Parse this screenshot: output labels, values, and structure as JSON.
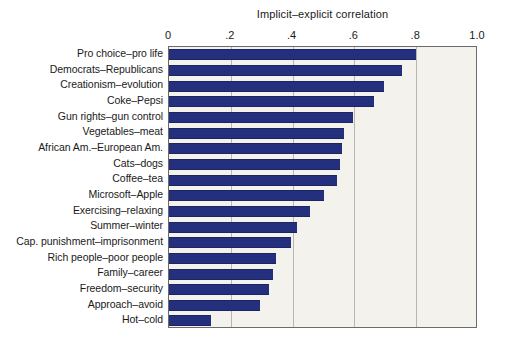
{
  "chart_data": {
    "type": "bar",
    "orientation": "horizontal",
    "title": "Implicit–explicit correlation",
    "xlabel": "Implicit–explicit correlation",
    "ylabel": "",
    "xlim": [
      0,
      1.0
    ],
    "xticks": [
      0,
      0.2,
      0.4,
      0.6,
      0.8,
      1.0
    ],
    "xticklabels": [
      "0",
      ".2",
      ".4",
      ".6",
      ".8",
      "1.0"
    ],
    "grid": true,
    "grid_axis": "x",
    "legend": false,
    "categories": [
      "Pro choice–pro life",
      "Democrats–Republicans",
      "Creationism–evolution",
      "Coke–Pepsi",
      "Gun rights–gun control",
      "Vegetables–meat",
      "African Am.–European Am.",
      "Cats–dogs",
      "Coffee–tea",
      "Microsoft–Apple",
      "Exercising–relaxing",
      "Summer–winter",
      "Cap. punishment–imprisonment",
      "Rich people–poor people",
      "Family–career",
      "Freedom–security",
      "Approach–avoid",
      "Hot–cold"
    ],
    "values": [
      0.8,
      0.755,
      0.695,
      0.665,
      0.595,
      0.565,
      0.56,
      0.555,
      0.545,
      0.5,
      0.455,
      0.415,
      0.395,
      0.345,
      0.335,
      0.325,
      0.295,
      0.135
    ],
    "bar_color": "#24307d",
    "plot_background": "#f4f2ec",
    "grid_color": "#b9b6ae",
    "frame_color": "#6b6b6b"
  }
}
